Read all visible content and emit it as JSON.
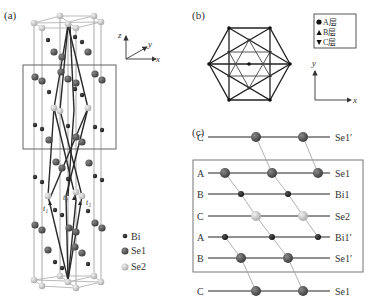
{
  "panels": {
    "a": {
      "label": "(a)",
      "axes": {
        "z": "z",
        "y": "y",
        "x": "x"
      },
      "vectors": [
        "t₁",
        "t₂",
        "t₃"
      ],
      "legend": [
        {
          "symbol": "Bi",
          "label": "Bi"
        },
        {
          "symbol": "Se1",
          "label": "Se1"
        },
        {
          "symbol": "Se2",
          "label": "Se2"
        }
      ]
    },
    "b": {
      "label": "(b)",
      "legend": [
        {
          "marker": "circle",
          "label": "A层"
        },
        {
          "marker": "triangle-up",
          "label": "B层"
        },
        {
          "marker": "triangle-down",
          "label": "C层"
        }
      ],
      "axes": {
        "y": "y",
        "x": "x"
      }
    },
    "c": {
      "label": "(c)",
      "layers": [
        {
          "stack": "C",
          "atom": "Se1′",
          "type": "Se1"
        },
        {
          "stack": "A",
          "atom": "Se1",
          "type": "Se1"
        },
        {
          "stack": "B",
          "atom": "Bi1",
          "type": "Bi"
        },
        {
          "stack": "C",
          "atom": "Se2",
          "type": "Se2"
        },
        {
          "stack": "A",
          "atom": "Bi1′",
          "type": "Bi"
        },
        {
          "stack": "B",
          "atom": "Se1′",
          "type": "Se1"
        },
        {
          "stack": "C",
          "atom": "Se1",
          "type": "Se1"
        }
      ]
    }
  },
  "colors": {
    "bi": "#1a1a1a",
    "se1": "#4a4a4a",
    "se2": "#c8c8c8",
    "line": "#333333",
    "thin": "#9a9a9a"
  }
}
